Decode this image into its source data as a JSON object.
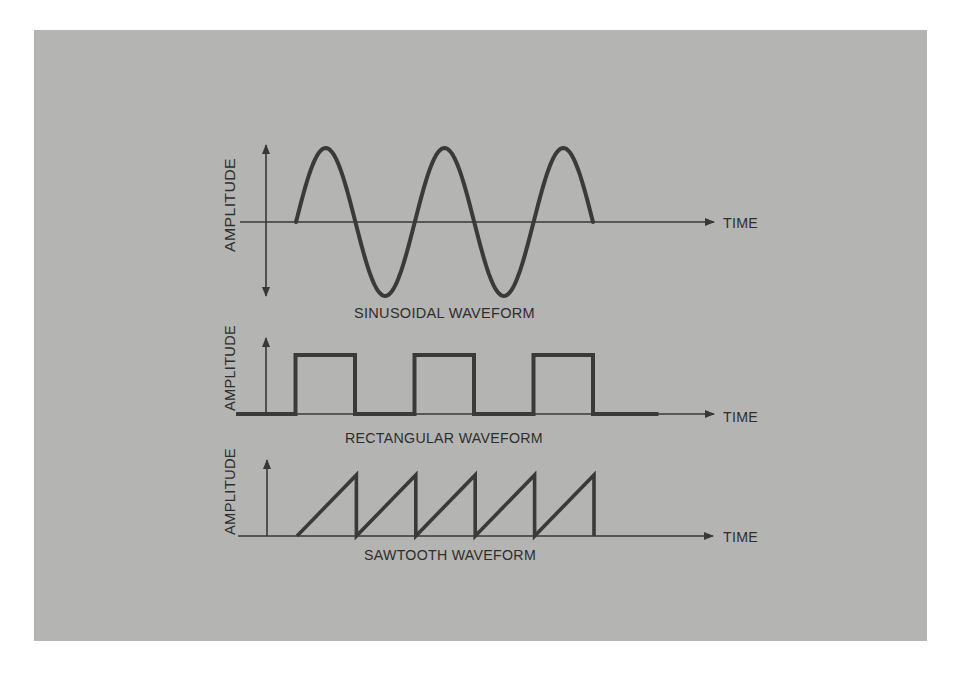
{
  "figure": {
    "background_color": "#b4b4b2",
    "ink_color": "#383838",
    "page_color": "#ffffff"
  },
  "panels": [
    {
      "id": "sinusoidal",
      "title": "SINUSOIDAL WAVEFORM",
      "y_axis_label": "AMPLITUDE",
      "x_axis_label": "TIME",
      "y_axis_bidirectional": true
    },
    {
      "id": "rectangular",
      "title": "RECTANGULAR WAVEFORM",
      "y_axis_label": "AMPLITUDE",
      "x_axis_label": "TIME",
      "y_axis_bidirectional": false
    },
    {
      "id": "sawtooth",
      "title": "SAWTOOTH WAVEFORM",
      "y_axis_label": "AMPLITUDE",
      "x_axis_label": "TIME",
      "y_axis_bidirectional": false
    }
  ],
  "chart_data": [
    {
      "type": "line",
      "title": "SINUSOIDAL WAVEFORM",
      "xlabel": "TIME",
      "ylabel": "AMPLITUDE",
      "description": "Sine wave, 2.5 cycles, starting at zero and rising",
      "cycles": 2.5,
      "x": [
        0,
        0.25,
        0.5,
        0.75,
        1.0,
        1.25,
        1.5,
        1.75,
        2.0,
        2.25,
        2.5
      ],
      "values": [
        0,
        1,
        0,
        -1,
        0,
        1,
        0,
        -1,
        0,
        1,
        0
      ],
      "ylim": [
        -1,
        1
      ]
    },
    {
      "type": "line",
      "title": "RECTANGULAR WAVEFORM",
      "xlabel": "TIME",
      "ylabel": "AMPLITUDE",
      "description": "Rectangular pulse train, 3 pulses, 50% duty cycle",
      "pulses": 3,
      "duty_cycle": 0.5,
      "x": [
        0,
        0.5,
        0.5,
        1.0,
        1.0,
        1.5,
        1.5,
        2.0,
        2.0,
        2.5,
        2.5,
        3.0,
        3.0,
        3.55
      ],
      "values": [
        0,
        0,
        1,
        1,
        0,
        0,
        1,
        1,
        0,
        0,
        1,
        1,
        0,
        0
      ],
      "ylim": [
        0,
        1
      ]
    },
    {
      "type": "line",
      "title": "SAWTOOTH WAVEFORM",
      "xlabel": "TIME",
      "ylabel": "AMPLITUDE",
      "description": "Sawtooth wave, 5 linear ramps with vertical drops",
      "teeth": 5,
      "x": [
        0,
        1,
        1,
        2,
        2,
        3,
        3,
        4,
        4,
        5,
        5
      ],
      "values": [
        0,
        1,
        0,
        1,
        0,
        1,
        0,
        1,
        0,
        1,
        0
      ],
      "ylim": [
        0,
        1
      ]
    }
  ]
}
